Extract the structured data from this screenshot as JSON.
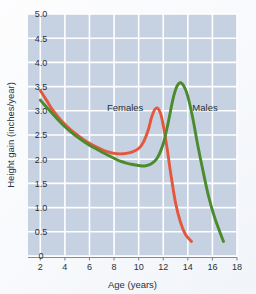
{
  "chart_data": {
    "type": "line",
    "title": "",
    "xlabel": "Age (years)",
    "ylabel": "Height gain (inches/year)",
    "xlim": [
      1,
      18
    ],
    "ylim": [
      0,
      5.0
    ],
    "grid": true,
    "legend_position": "inline-annotation",
    "plot_background_color": "#c6d1e1",
    "grid_color": "#ffffff",
    "xticks": [
      "2",
      "4",
      "6",
      "8",
      "10",
      "12",
      "14",
      "16",
      "18"
    ],
    "xtick_values": [
      2,
      4,
      6,
      8,
      10,
      12,
      14,
      16,
      18
    ],
    "yticks": [
      "0",
      "0.5",
      "1.0",
      "1.5",
      "2.0",
      "2.5",
      "3.0",
      "3.5",
      "4.0",
      "4.5",
      "5.0"
    ],
    "ytick_values": [
      0,
      0.5,
      1.0,
      1.5,
      2.0,
      2.5,
      3.0,
      3.5,
      4.0,
      4.5,
      5.0
    ],
    "series": [
      {
        "name": "Females",
        "color": "#e4573d",
        "label": "Females",
        "x": [
          2.0,
          2.5,
          3.0,
          3.5,
          4.0,
          4.5,
          5.0,
          5.5,
          6.0,
          6.5,
          7.0,
          7.5,
          8.0,
          8.5,
          9.0,
          9.5,
          10.0,
          10.4,
          10.8,
          11.0,
          11.2,
          11.4,
          11.6,
          11.8,
          12.0,
          12.3,
          12.6,
          13.0,
          13.4,
          13.8,
          14.3
        ],
        "values": [
          3.42,
          3.22,
          3.02,
          2.86,
          2.72,
          2.6,
          2.5,
          2.41,
          2.33,
          2.26,
          2.2,
          2.15,
          2.12,
          2.11,
          2.12,
          2.15,
          2.22,
          2.36,
          2.62,
          2.82,
          2.97,
          3.05,
          3.04,
          2.93,
          2.7,
          2.25,
          1.72,
          1.1,
          0.7,
          0.45,
          0.3
        ]
      },
      {
        "name": "Males",
        "color": "#4b8b2d",
        "label": "Males",
        "x": [
          2.0,
          2.5,
          3.0,
          3.5,
          4.0,
          4.5,
          5.0,
          5.5,
          6.0,
          6.5,
          7.0,
          7.5,
          8.0,
          8.5,
          9.0,
          9.5,
          10.0,
          10.5,
          11.0,
          11.5,
          12.0,
          12.4,
          12.8,
          13.1,
          13.4,
          13.7,
          14.0,
          14.4,
          14.8,
          15.2,
          15.7,
          16.2,
          16.9
        ],
        "values": [
          3.22,
          3.08,
          2.94,
          2.8,
          2.67,
          2.56,
          2.46,
          2.37,
          2.29,
          2.22,
          2.15,
          2.08,
          2.02,
          1.96,
          1.92,
          1.89,
          1.87,
          1.86,
          1.9,
          2.02,
          2.32,
          2.75,
          3.25,
          3.5,
          3.58,
          3.5,
          3.3,
          2.85,
          2.3,
          1.8,
          1.22,
          0.78,
          0.3
        ]
      }
    ],
    "annotations": [
      {
        "text": "Females",
        "x": 8.9,
        "y": 3.0
      },
      {
        "text": "Males",
        "x": 15.4,
        "y": 3.0
      }
    ]
  }
}
